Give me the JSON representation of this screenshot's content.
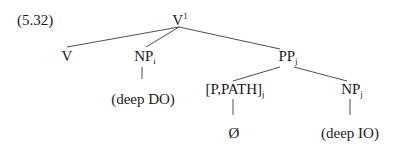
{
  "example_number": "(5.32)",
  "tree": {
    "root": {
      "label": "V",
      "superscript": "1"
    },
    "nodes": {
      "v": {
        "label": "V"
      },
      "np_i": {
        "label": "NP",
        "subscript": "i"
      },
      "pp_j": {
        "label": "PP",
        "subscript": "j"
      },
      "deep_do": {
        "label": "(deep DO)"
      },
      "p_path": {
        "label": "[P,PATH]",
        "subscript": "j"
      },
      "np_j": {
        "label": "NP",
        "subscript": "j"
      },
      "null": {
        "label": "Ø"
      },
      "deep_io": {
        "label": "(deep IO)"
      }
    },
    "edges": [
      [
        "root",
        "v"
      ],
      [
        "root",
        "np_i"
      ],
      [
        "root",
        "pp_j"
      ],
      [
        "np_i",
        "deep_do"
      ],
      [
        "pp_j",
        "p_path"
      ],
      [
        "pp_j",
        "np_j"
      ],
      [
        "p_path",
        "null"
      ],
      [
        "np_j",
        "deep_io"
      ]
    ]
  }
}
